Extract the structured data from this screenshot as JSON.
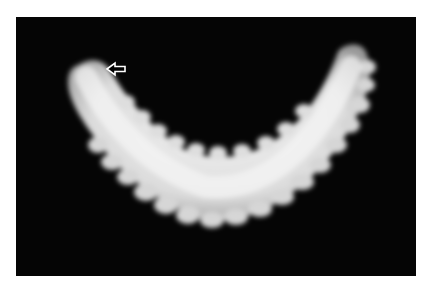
{
  "image": {
    "subject": "white segmented larva on black background",
    "background_color": "#050505",
    "subject_color": "#e4e4e4",
    "annotation": {
      "type": "arrow",
      "direction": "left",
      "icon": "left-arrow-icon",
      "color": "#ffffff"
    }
  }
}
